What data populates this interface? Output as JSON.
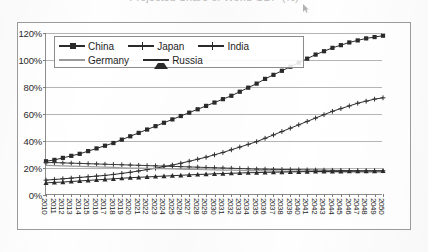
{
  "title": "Projected Share of World GDP (%)",
  "cursor_icon": "mouse-pointer-icon",
  "legend": {
    "position": "inside-top-left",
    "rows": [
      [
        {
          "name": "China",
          "marker": "square"
        },
        {
          "name": "Japan",
          "marker": "plus"
        },
        {
          "name": "India",
          "marker": "plus"
        }
      ],
      [
        {
          "name": "Germany",
          "marker": "none"
        },
        {
          "name": "Russia",
          "marker": "triangle"
        }
      ]
    ]
  },
  "chart_data": {
    "type": "line",
    "title": "Projected Share of World GDP (%)",
    "xlabel": "",
    "ylabel": "",
    "ylim": [
      0,
      120
    ],
    "yticks": [
      0,
      20,
      40,
      60,
      80,
      100,
      120
    ],
    "ytick_labels": [
      "0%",
      "20%",
      "40%",
      "60%",
      "80%",
      "100%",
      "120%"
    ],
    "grid": true,
    "legend_position": "inside top-left",
    "x": [
      2010,
      2011,
      2012,
      2013,
      2014,
      2015,
      2016,
      2017,
      2018,
      2019,
      2020,
      2021,
      2022,
      2023,
      2024,
      2025,
      2026,
      2027,
      2028,
      2029,
      2030,
      2031,
      2032,
      2033,
      2034,
      2035,
      2036,
      2037,
      2038,
      2039,
      2040,
      2041,
      2042,
      2043,
      2044,
      2045,
      2046,
      2047,
      2048,
      2049,
      2050
    ],
    "categories": [
      "2010",
      "2011",
      "2012",
      "2013",
      "2014",
      "2015",
      "2016",
      "2017",
      "2018",
      "2019",
      "2020",
      "2021",
      "2022",
      "2023",
      "2024",
      "2025",
      "2026",
      "2027",
      "2028",
      "2029",
      "2030",
      "2031",
      "2032",
      "2033",
      "2034",
      "2035",
      "2036",
      "2037",
      "2038",
      "2039",
      "2040",
      "2041",
      "2042",
      "2043",
      "2044",
      "2045",
      "2046",
      "2047",
      "2048",
      "2049",
      "2050"
    ],
    "series": [
      {
        "name": "China",
        "marker": "square",
        "color": "#2a2a2a",
        "values": [
          25,
          26,
          27.5,
          29,
          30.5,
          32.5,
          34.5,
          36.5,
          38.5,
          41,
          43.5,
          46,
          48.5,
          51,
          53.5,
          56,
          58.5,
          61,
          63.5,
          66,
          68.5,
          71,
          73.5,
          76.5,
          79.5,
          82.5,
          86,
          89,
          92,
          95,
          98,
          101,
          104,
          106.5,
          109,
          111,
          113,
          114.5,
          116,
          117,
          118
        ]
      },
      {
        "name": "Japan",
        "marker": "plus",
        "color": "#3a3a3a",
        "values": [
          24,
          24,
          23.8,
          23.6,
          23.4,
          23.2,
          23,
          22.8,
          22.6,
          22.4,
          22.2,
          22,
          21.8,
          21.6,
          21.4,
          21.2,
          21,
          20.8,
          20.6,
          20.4,
          20.2,
          20,
          19.8,
          19.6,
          19.4,
          19.2,
          19.1,
          19,
          18.9,
          18.8,
          18.7,
          18.6,
          18.5,
          18.4,
          18.3,
          18.2,
          18.1,
          18,
          18,
          18,
          18
        ]
      },
      {
        "name": "India",
        "marker": "plus",
        "color": "#2f2f2f",
        "values": [
          11,
          11.5,
          12,
          12.5,
          13,
          13.5,
          14,
          14.5,
          15.2,
          16,
          16.8,
          17.8,
          18.8,
          19.8,
          21,
          22.2,
          23.5,
          25,
          26.5,
          28,
          29.8,
          31.5,
          33.5,
          35.5,
          37.5,
          39.5,
          42,
          44.5,
          47,
          49.5,
          52,
          54.5,
          57,
          59.5,
          62,
          64,
          66,
          68,
          69.5,
          71,
          72
        ]
      },
      {
        "name": "Germany",
        "marker": "none",
        "color": "#9a9a9a",
        "values": [
          22,
          21.8,
          21.6,
          21.4,
          21.2,
          21,
          20.8,
          20.6,
          20.4,
          20.2,
          20,
          19.9,
          19.8,
          19.6,
          19.5,
          19.3,
          19.2,
          19,
          18.9,
          18.7,
          18.6,
          18.5,
          18.4,
          18.2,
          18.1,
          18,
          17.9,
          17.8,
          17.7,
          17.6,
          17.5,
          17.4,
          17.3,
          17.2,
          17.1,
          17,
          17,
          17,
          17,
          17,
          17
        ]
      },
      {
        "name": "Russia",
        "marker": "triangle",
        "color": "#2a2a2a",
        "values": [
          9,
          9.3,
          9.6,
          10,
          10.4,
          10.8,
          11.2,
          11.6,
          12,
          12.4,
          12.8,
          13.1,
          13.4,
          13.7,
          14,
          14.3,
          14.6,
          14.9,
          15.2,
          15.4,
          15.7,
          15.9,
          16.1,
          16.3,
          16.5,
          16.6,
          16.8,
          16.9,
          17,
          17.1,
          17.2,
          17.3,
          17.4,
          17.4,
          17.5,
          17.5,
          17.6,
          17.6,
          17.7,
          17.7,
          17.8
        ]
      }
    ]
  }
}
